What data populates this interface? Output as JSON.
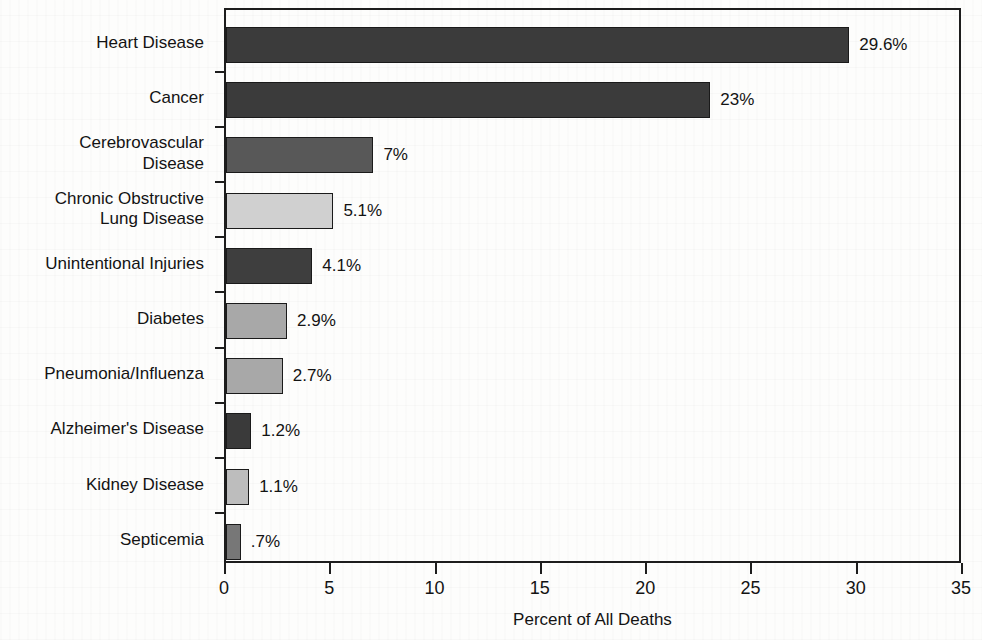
{
  "chart_data": {
    "type": "bar",
    "orientation": "horizontal",
    "title": "",
    "xlabel": "Percent of All Deaths",
    "ylabel": "",
    "xlim": [
      0,
      35
    ],
    "xticks": [
      "0",
      "5",
      "10",
      "15",
      "20",
      "25",
      "30",
      "35"
    ],
    "grid": false,
    "legend": "none",
    "categories": [
      "Heart Disease",
      "Cancer",
      "Cerebrovascular Disease",
      "Chronic Obstructive Lung Disease",
      "Unintentional Injuries",
      "Diabetes",
      "Pneumonia/Influenza",
      "Alzheimer's Disease",
      "Kidney Disease",
      "Septicemia"
    ],
    "category_lines": [
      [
        "Heart Disease"
      ],
      [
        "Cancer"
      ],
      [
        "Cerebrovascular",
        "Disease"
      ],
      [
        "Chronic Obstructive",
        "Lung Disease"
      ],
      [
        "Unintentional Injuries"
      ],
      [
        "Diabetes"
      ],
      [
        "Pneumonia/Influenza"
      ],
      [
        "Alzheimer's Disease"
      ],
      [
        "Kidney Disease"
      ],
      [
        "Septicemia"
      ]
    ],
    "values": [
      29.6,
      23,
      7,
      5.1,
      4.1,
      2.9,
      2.7,
      1.2,
      1.1,
      0.7
    ],
    "value_labels": [
      "29.6%",
      "23%",
      "7%",
      "5.1%",
      "4.1%",
      "2.9%",
      "2.7%",
      "1.2%",
      "1.1%",
      ".7%"
    ],
    "bar_colors": [
      "#3b3b3b",
      "#3b3b3b",
      "#585858",
      "#d0d0d0",
      "#3e3e3e",
      "#a8a8a8",
      "#a8a8a8",
      "#3a3a3a",
      "#bdbdbd",
      "#777777"
    ],
    "axis_color": "#1d1d1d",
    "text_color": "#131313",
    "background_color": "#fdfdfc"
  }
}
